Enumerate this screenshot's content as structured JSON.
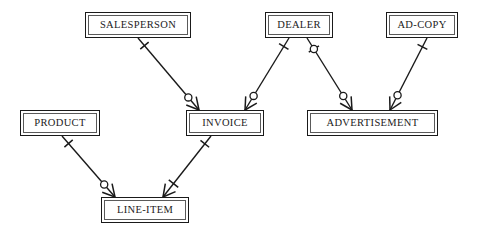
{
  "diagram": {
    "type": "er-diagram",
    "width": 478,
    "height": 238,
    "background_color": "#ffffff",
    "line_color": "#1a1a1a",
    "text_color": "#1b1b1b",
    "entities": [
      {
        "id": "salesperson",
        "label": "SALESPERSON",
        "x": 85,
        "y": 12,
        "w": 106,
        "h": 26
      },
      {
        "id": "dealer",
        "label": "DEALER",
        "x": 265,
        "y": 12,
        "w": 68,
        "h": 26
      },
      {
        "id": "adcopy",
        "label": "AD-COPY",
        "x": 386,
        "y": 12,
        "w": 72,
        "h": 26
      },
      {
        "id": "product",
        "label": "PRODUCT",
        "x": 20,
        "y": 110,
        "w": 80,
        "h": 26
      },
      {
        "id": "invoice",
        "label": "INVOICE",
        "x": 186,
        "y": 110,
        "w": 78,
        "h": 26
      },
      {
        "id": "advertisement",
        "label": "ADVERTISEMENT",
        "x": 307,
        "y": 110,
        "w": 131,
        "h": 26
      },
      {
        "id": "lineitem",
        "label": "LINE-ITEM",
        "x": 101,
        "y": 197,
        "w": 88,
        "h": 26
      }
    ],
    "relationships": [
      {
        "id": "salesperson-invoice",
        "from": "salesperson",
        "to": "invoice",
        "from_label": "SALESPERSON",
        "to_label": "INVOICE",
        "from_cardinality": "exactly-one",
        "to_cardinality": "zero-or-many",
        "from_point": [
          138,
          38
        ],
        "to_point": [
          199,
          110
        ]
      },
      {
        "id": "dealer-invoice",
        "from": "dealer",
        "to": "invoice",
        "from_label": "DEALER",
        "to_label": "INVOICE",
        "from_cardinality": "exactly-one",
        "to_cardinality": "zero-or-many",
        "from_point": [
          289,
          38
        ],
        "to_point": [
          245,
          110
        ]
      },
      {
        "id": "dealer-advertisement",
        "from": "dealer",
        "to": "advertisement",
        "from_label": "DEALER",
        "to_label": "ADVERTISEMENT",
        "from_cardinality": "zero-or-one",
        "to_cardinality": "zero-or-many",
        "from_point": [
          307,
          38
        ],
        "to_point": [
          352,
          110
        ]
      },
      {
        "id": "adcopy-advertisement",
        "from": "adcopy",
        "to": "advertisement",
        "from_label": "AD-COPY",
        "to_label": "ADVERTISEMENT",
        "from_cardinality": "exactly-one",
        "to_cardinality": "zero-or-many",
        "from_point": [
          427,
          38
        ],
        "to_point": [
          390,
          110
        ]
      },
      {
        "id": "product-lineitem",
        "from": "product",
        "to": "lineitem",
        "from_label": "PRODUCT",
        "to_label": "LINE-ITEM",
        "from_cardinality": "exactly-one",
        "to_cardinality": "zero-or-many",
        "from_point": [
          62,
          136
        ],
        "to_point": [
          115,
          197
        ]
      },
      {
        "id": "invoice-lineitem",
        "from": "invoice",
        "to": "lineitem",
        "from_label": "INVOICE",
        "to_label": "LINE-ITEM",
        "from_cardinality": "exactly-one",
        "to_cardinality": "one-or-many",
        "from_point": [
          211,
          136
        ],
        "to_point": [
          163,
          197
        ]
      }
    ],
    "legend": {
      "notation": "crow's-foot",
      "symbols": {
        "exactly-one": "single tick across line",
        "zero-or-one": "circle with tick across line",
        "zero-or-many": "circle plus crow's foot",
        "one-or-many": "tick plus crow's foot"
      }
    }
  }
}
